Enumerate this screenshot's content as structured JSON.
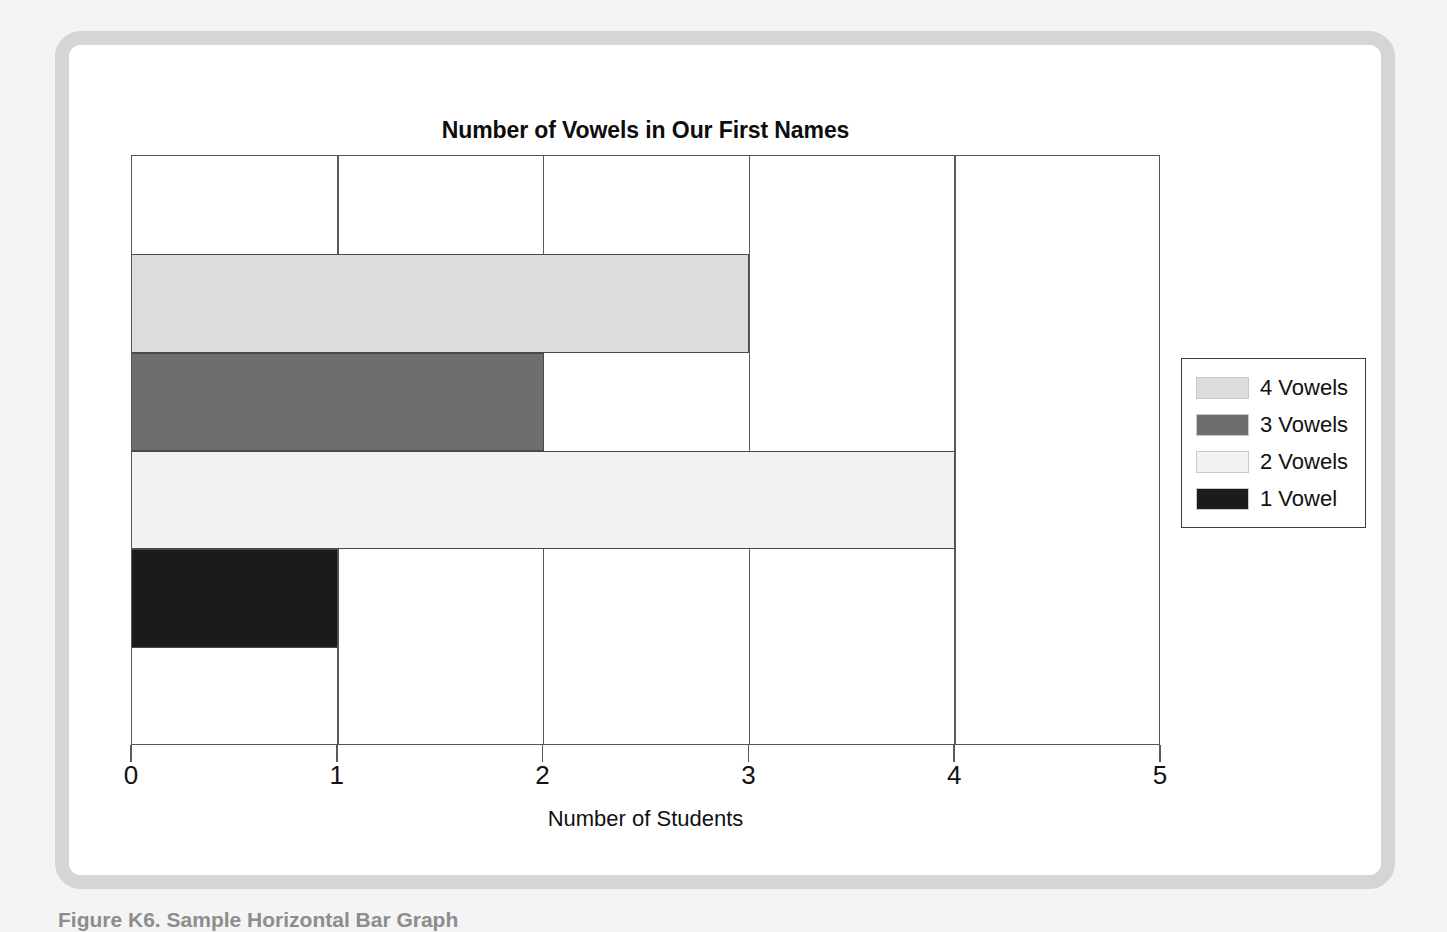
{
  "figure": {
    "caption": "Figure K6. Sample Horizontal Bar Graph"
  },
  "chart_data": {
    "type": "bar",
    "orientation": "horizontal",
    "title": "Number of Vowels in Our First Names",
    "xlabel": "Number of Students",
    "ylabel": "Number of Vowels",
    "xlim": [
      0,
      5
    ],
    "xticks": [
      "0",
      "1",
      "2",
      "3",
      "4",
      "5"
    ],
    "grid": true,
    "grid_axis": "x",
    "legend_position": "right",
    "categories": [
      "1 Vowel",
      "2 Vowels",
      "3 Vowels",
      "4 Vowels"
    ],
    "values": [
      1,
      4,
      2,
      3
    ],
    "bars": [
      {
        "label": "4 Vowels",
        "value": 3,
        "color": "#dcdcdc",
        "order": 0
      },
      {
        "label": "3 Vowels",
        "value": 2,
        "color": "#6e6e6e",
        "order": 1
      },
      {
        "label": "2 Vowels",
        "value": 4,
        "color": "#f2f2f2",
        "order": 2
      },
      {
        "label": "1 Vowel",
        "value": 1,
        "color": "#1b1b1b",
        "order": 3
      }
    ],
    "legend": [
      {
        "label": "4 Vowels",
        "color": "#dcdcdc"
      },
      {
        "label": "3 Vowels",
        "color": "#6e6e6e"
      },
      {
        "label": "2 Vowels",
        "color": "#f2f2f2"
      },
      {
        "label": "1 Vowel",
        "color": "#1b1b1b"
      }
    ]
  }
}
